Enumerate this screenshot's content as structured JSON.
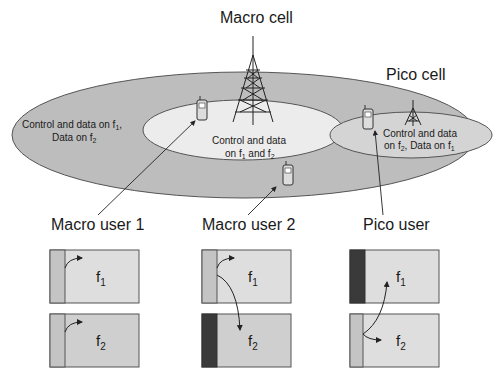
{
  "diagram": {
    "macro_cell": {
      "title": "Macro cell"
    },
    "pico_cell": {
      "title": "Pico cell"
    },
    "outer_region": {
      "line1": "Control and data on f",
      "line1_sub": "1",
      "line1_tail": ",",
      "line2": "Data on f",
      "line2_sub": "2"
    },
    "inner_region": {
      "line1": "Control and data",
      "line2a": "on f",
      "line2a_sub": "1",
      "line2b": " and f",
      "line2b_sub": "2"
    },
    "pico_region": {
      "line1": "Control and data",
      "line2a": "on f",
      "line2a_sub": "2",
      "line2b": ", Data on f",
      "line2b_sub": "1"
    },
    "users": [
      {
        "label": "Macro user 1"
      },
      {
        "label": "Macro user 2"
      },
      {
        "label": "Pico user"
      }
    ],
    "carriers": {
      "f1": {
        "base": "f",
        "sub": "1"
      },
      "f2": {
        "base": "f",
        "sub": "2"
      }
    },
    "colors": {
      "outer_ellipse": "#bdbdbd",
      "inner_ellipse": "#ececec",
      "pico_ellipse": "#d4d4d4",
      "box_light": "#dedede",
      "box_mid": "#cfcfcf",
      "control_light": "#c4c4c4",
      "control_blocked": "#3a3a3a",
      "stroke": "#555555"
    }
  }
}
